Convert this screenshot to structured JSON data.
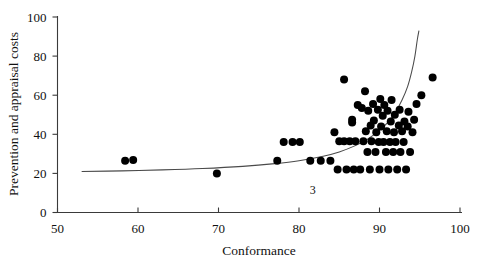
{
  "chart_data": {
    "type": "scatter",
    "title": "",
    "subtitle": "",
    "xlabel": "Conformance",
    "ylabel": "Prevention and appraisal costs",
    "xlim": [
      50,
      100
    ],
    "ylim": [
      0,
      100
    ],
    "xticks": [
      50,
      60,
      70,
      80,
      90,
      100
    ],
    "yticks": [
      0,
      20,
      40,
      60,
      80,
      100
    ],
    "xtick_labels": [
      "50",
      "60",
      "70",
      "80",
      "90",
      "100"
    ],
    "ytick_labels": [
      "0",
      "20",
      "40",
      "60",
      "80",
      "100"
    ],
    "grid": false,
    "legend": false,
    "legend_position": "none",
    "marker": "filled-circle",
    "marker_color": "#000000",
    "marker_size_px": 8,
    "points": [
      [
        58.4,
        26.5
      ],
      [
        59.4,
        26.8
      ],
      [
        69.8,
        20.0
      ],
      [
        77.3,
        26.5
      ],
      [
        78.1,
        36.0
      ],
      [
        79.2,
        36.0
      ],
      [
        80.1,
        36.0
      ],
      [
        81.4,
        26.5
      ],
      [
        82.7,
        26.5
      ],
      [
        83.9,
        26.5
      ],
      [
        84.4,
        41.0
      ],
      [
        84.8,
        22.0
      ],
      [
        85.0,
        36.5
      ],
      [
        85.6,
        36.5
      ],
      [
        85.6,
        68.0
      ],
      [
        85.9,
        22.0
      ],
      [
        86.3,
        36.5
      ],
      [
        86.6,
        46.0
      ],
      [
        86.6,
        47.5
      ],
      [
        86.8,
        22.0
      ],
      [
        87.0,
        36.5
      ],
      [
        87.3,
        55.0
      ],
      [
        87.6,
        22.0
      ],
      [
        87.8,
        53.5
      ],
      [
        88.0,
        36.5
      ],
      [
        88.2,
        62.0
      ],
      [
        88.3,
        41.5
      ],
      [
        88.5,
        31.0
      ],
      [
        88.6,
        52.0
      ],
      [
        88.8,
        22.0
      ],
      [
        88.9,
        44.5
      ],
      [
        89.0,
        36.5
      ],
      [
        89.2,
        55.5
      ],
      [
        89.3,
        47.0
      ],
      [
        89.5,
        31.0
      ],
      [
        89.6,
        41.0
      ],
      [
        89.8,
        52.5
      ],
      [
        89.9,
        36.0
      ],
      [
        90.0,
        22.0
      ],
      [
        90.1,
        58.0
      ],
      [
        90.2,
        44.0
      ],
      [
        90.4,
        49.5
      ],
      [
        90.5,
        36.0
      ],
      [
        90.6,
        55.0
      ],
      [
        90.8,
        31.0
      ],
      [
        90.9,
        41.5
      ],
      [
        91.0,
        52.0
      ],
      [
        91.1,
        22.0
      ],
      [
        91.3,
        36.0
      ],
      [
        91.4,
        46.5
      ],
      [
        91.5,
        57.5
      ],
      [
        91.7,
        31.0
      ],
      [
        91.8,
        41.0
      ],
      [
        91.9,
        50.0
      ],
      [
        92.0,
        36.0
      ],
      [
        92.2,
        22.0
      ],
      [
        92.4,
        44.5
      ],
      [
        92.5,
        52.5
      ],
      [
        92.6,
        31.0
      ],
      [
        92.8,
        41.5
      ],
      [
        93.0,
        36.0
      ],
      [
        93.1,
        46.5
      ],
      [
        93.3,
        22.0
      ],
      [
        93.5,
        44.0
      ],
      [
        93.6,
        51.5
      ],
      [
        93.8,
        31.0
      ],
      [
        94.1,
        41.0
      ],
      [
        94.3,
        47.5
      ],
      [
        94.6,
        55.5
      ],
      [
        95.2,
        60.0
      ],
      [
        96.6,
        69.0
      ]
    ],
    "fit_curve": {
      "label": "3",
      "label_x": 81.7,
      "label_y": 9.5,
      "description": "exponential trend line",
      "points": [
        [
          53.0,
          21.0
        ],
        [
          58.0,
          21.3
        ],
        [
          63.0,
          21.8
        ],
        [
          68.0,
          22.5
        ],
        [
          73.0,
          23.6
        ],
        [
          77.0,
          25.0
        ],
        [
          80.0,
          26.5
        ],
        [
          83.0,
          28.8
        ],
        [
          85.0,
          31.0
        ],
        [
          87.0,
          34.2
        ],
        [
          88.5,
          37.5
        ],
        [
          90.0,
          42.0
        ],
        [
          91.0,
          46.0
        ],
        [
          92.0,
          51.5
        ],
        [
          92.8,
          57.5
        ],
        [
          93.5,
          64.5
        ],
        [
          94.0,
          72.0
        ],
        [
          94.4,
          80.0
        ],
        [
          94.7,
          88.5
        ],
        [
          94.9,
          93.0
        ]
      ]
    }
  }
}
